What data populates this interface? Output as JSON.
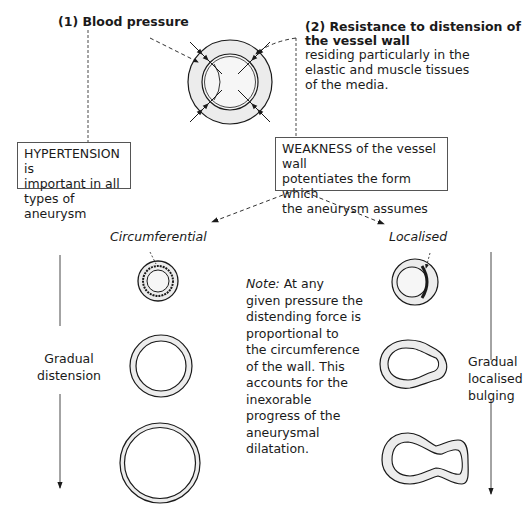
{
  "labels": {
    "blood_pressure": "(1) Blood pressure",
    "resistance_title_1": "(2) Resistance to distension of",
    "resistance_title_2": "the vessel wall",
    "resistance_desc_1": "residing particularly in the",
    "resistance_desc_2": "elastic and muscle tissues",
    "resistance_desc_3": "of the media."
  },
  "boxes": {
    "hypertension": [
      "HYPERTENSION is",
      "important in all",
      "types of aneurysm"
    ],
    "weakness": [
      "WEAKNESS of the vessel wall",
      "potentiates the form which",
      "the aneurysm assumes"
    ]
  },
  "branches": {
    "circumferential": "Circumferential",
    "localised": "Localised"
  },
  "note": {
    "prefix": "Note:",
    "lines": [
      " At any",
      "given pressure the",
      "distending force is",
      "proportional to",
      "the circumference",
      "of the wall. This",
      "accounts for the",
      "inexorable",
      "progress of the",
      "aneurysmal",
      "dilatation."
    ]
  },
  "side_labels": {
    "left": [
      "Gradual",
      "distension"
    ],
    "right": [
      "Gradual",
      "localised",
      "bulging"
    ]
  },
  "colors": {
    "ink": "#1a1a1a",
    "wall_fill": "#ececec",
    "lumen_fill": "#f6f6f6"
  }
}
